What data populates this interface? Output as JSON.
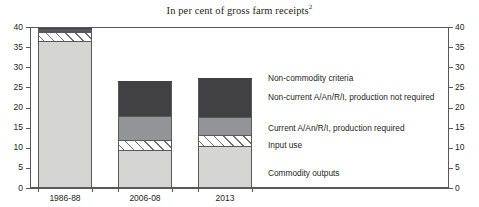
{
  "header": {
    "title": "In per cent of gross farm receipts",
    "title_footnote": "2"
  },
  "axes": {
    "y_ticks": [
      "0",
      "5",
      "10",
      "15",
      "20",
      "25",
      "30",
      "35",
      "40"
    ],
    "x_categories": [
      "1986-88",
      "2006-08",
      "2013"
    ]
  },
  "legend": {
    "items": [
      {
        "label": "Non-commodity criteria",
        "key": "noncommodity",
        "color": "#58595b"
      },
      {
        "label": "Non-current A/An/R/I, production not required",
        "key": "noncurrent",
        "color": "#414042"
      },
      {
        "label": "Current A/An/R/I, production required",
        "key": "current",
        "color": "#929497"
      },
      {
        "label": "Input use",
        "key": "input",
        "color": "#ffffff"
      },
      {
        "label": "Commodity outputs",
        "key": "outputs",
        "color": "#d5d6d4"
      }
    ]
  },
  "chart_data": {
    "type": "bar",
    "stacked": true,
    "title": "In per cent of gross farm receipts",
    "xlabel": "",
    "ylabel": "",
    "ylim": [
      0,
      40
    ],
    "ytick_step": 5,
    "grid": true,
    "legend_position": "right-inside",
    "dual_axis": true,
    "categories": [
      "1986-88",
      "2006-08",
      "2013"
    ],
    "series": [
      {
        "name": "Commodity outputs",
        "values": [
          36.3,
          9.2,
          10.2
        ]
      },
      {
        "name": "Input use",
        "values": [
          2.2,
          2.5,
          2.7
        ]
      },
      {
        "name": "Current A/An/R/I, production required",
        "values": [
          0.0,
          6.0,
          4.5
        ]
      },
      {
        "name": "Non-current A/An/R/I, production not required",
        "values": [
          0.0,
          8.9,
          10.0
        ]
      },
      {
        "name": "Non-commodity criteria",
        "values": [
          1.3,
          0.0,
          0.0
        ]
      }
    ],
    "totals": [
      39.8,
      26.6,
      27.4
    ]
  }
}
